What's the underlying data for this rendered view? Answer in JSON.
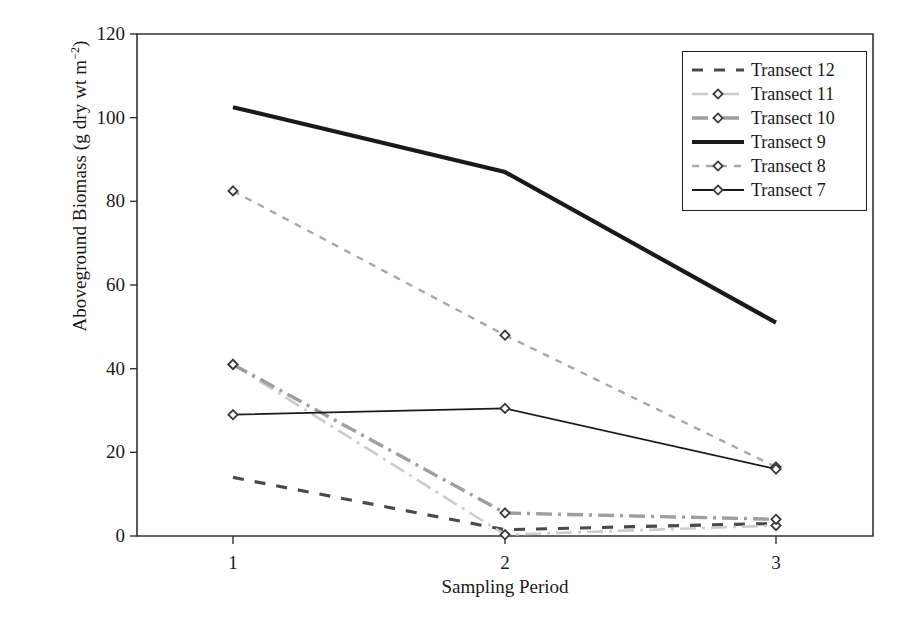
{
  "chart_data": {
    "type": "line",
    "title": "",
    "xlabel": "Sampling Period",
    "ylabel": "Aboveground Biomass (g dry wt m-2)",
    "ylabel_main": "Aboveground Biomass (g dry wt m",
    "ylabel_exp": "−2",
    "ylabel_tail": ")",
    "categories": [
      "1",
      "2",
      "3"
    ],
    "x": [
      1,
      2,
      3
    ],
    "xlim": [
      0.5,
      3.5
    ],
    "ylim": [
      0,
      120
    ],
    "yticks": [
      0,
      20,
      40,
      60,
      80,
      100,
      120
    ],
    "xticks": [
      "1",
      "2",
      "3"
    ],
    "grid": false,
    "legend_position": "top-right",
    "series": [
      {
        "name": "Transect 12",
        "values": [
          14,
          1.5,
          3
        ],
        "color": "#4a4a4a",
        "style": "dashed",
        "width": 3.2,
        "marker": "none"
      },
      {
        "name": "Transect 11",
        "values": [
          41,
          0.3,
          2.5
        ],
        "color": "#cccccc",
        "style": "dashdot",
        "width": 2.6,
        "marker": "diamond"
      },
      {
        "name": "Transect 10",
        "values": [
          41,
          5.5,
          4
        ],
        "color": "#9e9e9e",
        "style": "dashdot",
        "width": 3.4,
        "marker": "diamond"
      },
      {
        "name": "Transect 9",
        "values": [
          102.5,
          87,
          51
        ],
        "color": "#1a1a1a",
        "style": "solid",
        "width": 4.2,
        "marker": "none"
      },
      {
        "name": "Transect 8",
        "values": [
          82.5,
          48,
          16.5
        ],
        "color": "#a8a8a8",
        "style": "dashed",
        "width": 2.4,
        "marker": "diamond"
      },
      {
        "name": "Transect 7",
        "values": [
          29,
          30.5,
          16
        ],
        "color": "#1a1a1a",
        "style": "solid",
        "width": 1.8,
        "marker": "diamond"
      }
    ]
  },
  "axes": {
    "frame_color": "#333333",
    "background": "#ffffff"
  }
}
